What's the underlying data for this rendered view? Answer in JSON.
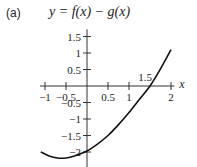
{
  "chart_data": {
    "type": "line",
    "panel_label": "(a)",
    "title": "y = f(x) − g(x)",
    "xlabel": "x",
    "ylabel": "",
    "xlim": [
      -1.2,
      2.1
    ],
    "ylim": [
      -2.3,
      1.7
    ],
    "x_ticks": [
      -1,
      -0.5,
      0.5,
      1,
      2
    ],
    "x_tick_labels": [
      "−1",
      "−0.5",
      "0.5",
      "1",
      "2"
    ],
    "y_ticks": [
      1.5,
      1,
      0.5,
      -0.5,
      -1,
      -1.5,
      -2
    ],
    "y_tick_labels": [
      "1.5",
      "1",
      "0.5",
      "−0.5",
      "−1",
      "−1.5",
      "−2"
    ],
    "annotations": [
      {
        "text": "1.5",
        "x": 1.5,
        "y": 0,
        "note": "x-intercept"
      }
    ],
    "grid": false,
    "legend": "none",
    "series": [
      {
        "name": "f(x) - g(x)",
        "x": [
          -1.1,
          -0.9,
          -0.7,
          -0.5,
          -0.3,
          0,
          0.25,
          0.5,
          0.75,
          1,
          1.25,
          1.5,
          1.75,
          2
        ],
        "y": [
          -2.0,
          -2.12,
          -2.18,
          -2.18,
          -2.12,
          -1.97,
          -1.76,
          -1.5,
          -1.17,
          -0.8,
          -0.4,
          0.0,
          0.52,
          1.1
        ]
      }
    ]
  }
}
